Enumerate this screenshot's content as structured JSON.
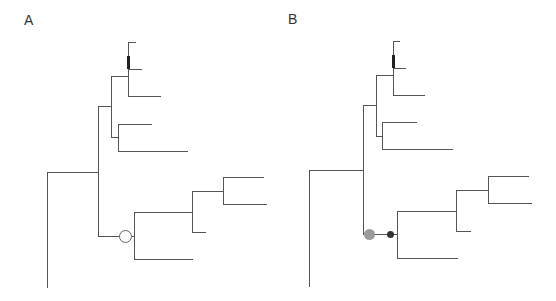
{
  "figure": {
    "panels": [
      {
        "id": "A",
        "label": "A",
        "branch_color": "#555555",
        "segments": [
          [
            47,
            172,
            47,
            287
          ],
          [
            47,
            172,
            98,
            172
          ],
          [
            98,
            106,
            98,
            236
          ],
          [
            98,
            106,
            111,
            106
          ],
          [
            111,
            76,
            111,
            137
          ],
          [
            111,
            76,
            128,
            76
          ],
          [
            128,
            42,
            128,
            96
          ],
          [
            128,
            42,
            135,
            42
          ],
          [
            128,
            69,
            141,
            69
          ],
          [
            128,
            96,
            160,
            96
          ],
          [
            111,
            137,
            118,
            137
          ],
          [
            118,
            124,
            118,
            151
          ],
          [
            118,
            124,
            151,
            124
          ],
          [
            118,
            151,
            187,
            151
          ],
          [
            98,
            236,
            134,
            236
          ],
          [
            134,
            212,
            134,
            259
          ],
          [
            134,
            259,
            192,
            259
          ],
          [
            134,
            212,
            192,
            212
          ],
          [
            192,
            191,
            192,
            232
          ],
          [
            192,
            232,
            205,
            232
          ],
          [
            192,
            191,
            223,
            191
          ],
          [
            223,
            177,
            223,
            204
          ],
          [
            223,
            177,
            263,
            177
          ],
          [
            223,
            204,
            266,
            204
          ]
        ],
        "thick_segments": [
          [
            128,
            56,
            128,
            69
          ]
        ],
        "markers": [
          {
            "type": "open-circle",
            "cx": 125,
            "cy": 236,
            "r": 6,
            "stroke": "#666666",
            "fill": "#ffffff"
          }
        ]
      },
      {
        "id": "B",
        "label": "B",
        "branch_color": "#555555",
        "segments": [
          [
            309,
            170,
            309,
            286
          ],
          [
            309,
            170,
            363,
            170
          ],
          [
            363,
            105,
            363,
            234
          ],
          [
            363,
            105,
            376,
            105
          ],
          [
            376,
            75,
            376,
            136
          ],
          [
            376,
            75,
            393,
            75
          ],
          [
            393,
            41,
            393,
            95
          ],
          [
            393,
            41,
            399,
            41
          ],
          [
            393,
            68,
            405,
            68
          ],
          [
            393,
            95,
            424,
            95
          ],
          [
            376,
            136,
            382,
            136
          ],
          [
            382,
            122,
            382,
            149
          ],
          [
            382,
            122,
            416,
            122
          ],
          [
            382,
            149,
            452,
            149
          ],
          [
            363,
            234,
            397,
            234
          ],
          [
            397,
            211,
            397,
            258
          ],
          [
            397,
            258,
            457,
            258
          ],
          [
            397,
            211,
            456,
            211
          ],
          [
            456,
            190,
            456,
            231
          ],
          [
            456,
            231,
            470,
            231
          ],
          [
            456,
            190,
            488,
            190
          ],
          [
            488,
            176,
            488,
            203
          ],
          [
            488,
            176,
            528,
            176
          ],
          [
            488,
            203,
            531,
            203
          ]
        ],
        "thick_segments": [
          [
            393,
            55,
            393,
            68
          ]
        ],
        "markers": [
          {
            "type": "filled-circle",
            "cx": 369,
            "cy": 234,
            "r": 5.5,
            "stroke": "none",
            "fill": "#9a9a9a"
          },
          {
            "type": "filled-circle",
            "cx": 390,
            "cy": 234,
            "r": 3.5,
            "stroke": "none",
            "fill": "#333333"
          }
        ]
      }
    ]
  }
}
